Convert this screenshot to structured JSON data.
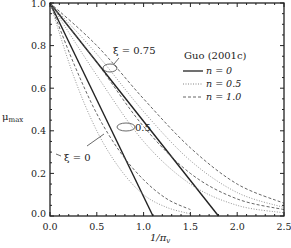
{
  "chart_data": {
    "type": "line",
    "title": "",
    "xlabel": "1/π_v",
    "ylabel": "μ_max",
    "xlim": [
      0.0,
      2.5
    ],
    "ylim": [
      0.0,
      1.0
    ],
    "xticks": [
      "0.0",
      "0.5",
      "1.0",
      "1.5",
      "2.0",
      "2.5"
    ],
    "yticks": [
      "0.0",
      "0.2",
      "0.4",
      "0.6",
      "0.8",
      "1.0"
    ],
    "grid": false,
    "legend": {
      "title": "Guo (2001c)",
      "position": "upper-right",
      "entries": [
        {
          "label": "n = 0",
          "style": "solid"
        },
        {
          "label": "n = 0.5",
          "style": "dotted"
        },
        {
          "label": "n = 1.0",
          "style": "dashed"
        }
      ]
    },
    "annotations": [
      {
        "text": "ξ = 0.75",
        "x": 0.78,
        "y": 0.8
      },
      {
        "text": "0.5",
        "x": 1.0,
        "y": 0.42
      },
      {
        "text": "ξ = 0",
        "x": 0.18,
        "y": 0.32
      }
    ],
    "series": [
      {
        "name": "n = 0, ξ = 0",
        "style": "solid",
        "x": [
          0.0,
          1.1
        ],
        "y": [
          1.0,
          0.0
        ]
      },
      {
        "name": "n = 0, ξ = 0.75",
        "style": "solid",
        "x": [
          0.0,
          1.8
        ],
        "y": [
          1.0,
          0.0
        ]
      },
      {
        "name": "n = 0.5, ξ = 0",
        "style": "dotted",
        "x": [
          0.0,
          0.25,
          0.5,
          0.75,
          1.0,
          1.25,
          1.5
        ],
        "y": [
          1.0,
          0.66,
          0.4,
          0.22,
          0.1,
          0.04,
          0.01
        ]
      },
      {
        "name": "n = 0.5, ξ = 0.5",
        "style": "dotted",
        "x": [
          0.0,
          0.5,
          1.0,
          1.5,
          2.0,
          2.5
        ],
        "y": [
          1.0,
          0.66,
          0.35,
          0.15,
          0.05,
          0.015
        ]
      },
      {
        "name": "n = 0.5, ξ = 0.75",
        "style": "dotted",
        "x": [
          0.0,
          0.5,
          1.0,
          1.5,
          2.0,
          2.5
        ],
        "y": [
          1.0,
          0.76,
          0.49,
          0.26,
          0.11,
          0.04
        ]
      },
      {
        "name": "n = 1.0, ξ = 0",
        "style": "dashed",
        "x": [
          0.0,
          0.25,
          0.5,
          0.75,
          1.0,
          1.25,
          1.5
        ],
        "y": [
          1.0,
          0.72,
          0.48,
          0.3,
          0.17,
          0.08,
          0.03
        ]
      },
      {
        "name": "n = 1.0, ξ = 0.5",
        "style": "dashed",
        "x": [
          0.0,
          0.5,
          1.0,
          1.5,
          2.0,
          2.5
        ],
        "y": [
          1.0,
          0.72,
          0.42,
          0.2,
          0.08,
          0.03
        ]
      },
      {
        "name": "n = 1.0, ξ = 0.75",
        "style": "dashed",
        "x": [
          0.0,
          0.5,
          1.0,
          1.5,
          2.0,
          2.5
        ],
        "y": [
          1.0,
          0.8,
          0.55,
          0.32,
          0.15,
          0.06
        ]
      }
    ]
  }
}
